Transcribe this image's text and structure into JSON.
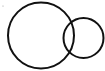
{
  "diagram": {
    "type": "venn",
    "background": "#ffffff",
    "stroke_color": "#111111",
    "stroke_width": 2,
    "marker": {
      "cx": 3,
      "cy": 6,
      "r": 0.6,
      "color": "#9a9a9a"
    },
    "circles": [
      {
        "name": "large-circle",
        "cx": 41,
        "cy": 35.5,
        "r": 33
      },
      {
        "name": "small-circle",
        "cx": 83.5,
        "cy": 38,
        "r": 20
      }
    ]
  }
}
